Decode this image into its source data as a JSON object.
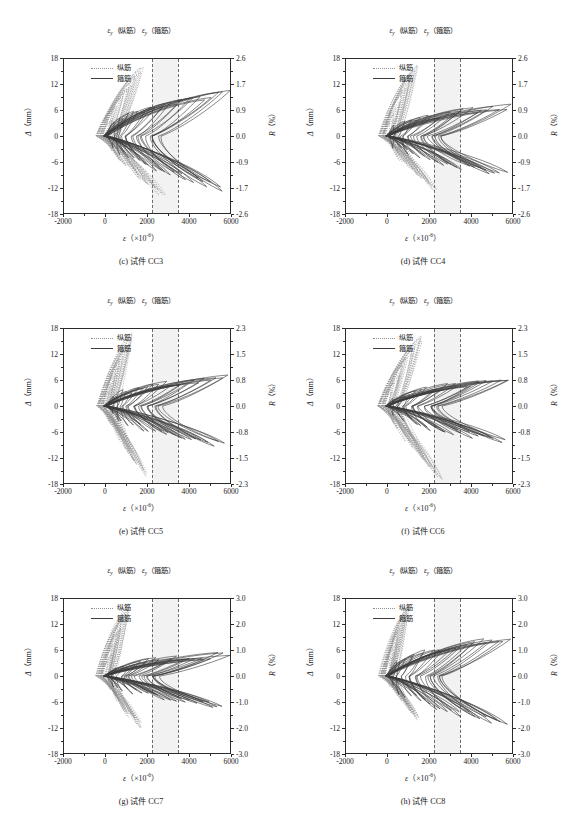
{
  "figure": {
    "annotation_prefix_sym": "ε",
    "annotation_sub": "y",
    "annotation_long": "（纵筋）",
    "annotation_stirrup": "（箍筋）",
    "legend": {
      "longitudinal": "纵筋",
      "stirrup": "箍筋"
    },
    "axis": {
      "left_title_sym": "Δ",
      "left_title_unit": "（mm）",
      "right_title_sym": "R",
      "right_title_unit": "（%）",
      "bottom_title_sym": "ε",
      "bottom_title_unit_pre": "（×10",
      "bottom_title_sup": "-6",
      "bottom_title_unit_post": "）"
    },
    "x_ticks": [
      "-2000",
      "0",
      "2000",
      "4000",
      "6000"
    ],
    "x_range": [
      -2000,
      6000
    ],
    "y_ticks": [
      "18",
      "12",
      "6",
      "0",
      "-6",
      "-12",
      "-18"
    ],
    "y_range": [
      -18,
      18
    ],
    "yield_line_long": 2200,
    "yield_line_stirrup": 3450,
    "colors": {
      "solid_curve": "#3b3b3b",
      "dotted_curve": "#8f8f8f",
      "band": "#f2f2f2",
      "dashed_line": "#6a6a6a",
      "frame": "#2b2b2b"
    }
  },
  "chart_data": [
    {
      "id": "cc3",
      "type": "line",
      "title": "(c) 试件 CC3",
      "caption": "(c) 试件 CC3",
      "xlabel": "ε（×10-6）",
      "ylabel": "Δ（mm）",
      "y2label": "R（%）",
      "xlim": [
        -2000,
        6000
      ],
      "ylim": [
        -18,
        18
      ],
      "y2lim": [
        -2.6,
        2.6
      ],
      "xticks": [
        -2000,
        0,
        2000,
        4000,
        6000
      ],
      "yticks": [
        18,
        12,
        6,
        0,
        -6,
        -12,
        -18
      ],
      "y2ticks": [
        "2.6",
        "1.7",
        "0.9",
        "0.0",
        "-0.9",
        "-1.7",
        "-2.6"
      ],
      "grid": false,
      "legend_position": "top-left",
      "series": [
        {
          "name": "纵筋",
          "style": "dotted",
          "color": "#8f8f8f"
        },
        {
          "name": "箍筋",
          "style": "solid",
          "color": "#3b3b3b"
        }
      ],
      "annotations": [
        {
          "text": "εy（纵筋）",
          "x": 2200,
          "type": "vline-dashed"
        },
        {
          "text": "εy（箍筋）",
          "x": 3450,
          "type": "vline-dashed"
        }
      ],
      "solid_envelope_max_strain": 6000,
      "dotted_envelope_max_strain": 2700,
      "dotted_envelope_min_disp": -14,
      "solid_envelope_max_disp": 10
    },
    {
      "id": "cc4",
      "type": "line",
      "title": "(d) 试件 CC4",
      "caption": "(d) 试件 CC4",
      "xlabel": "ε（×10-6）",
      "ylabel": "Δ（mm）",
      "y2label": "R（%）",
      "xlim": [
        -2000,
        6000
      ],
      "ylim": [
        -18,
        18
      ],
      "y2lim": [
        -2.6,
        2.6
      ],
      "xticks": [
        -2000,
        0,
        2000,
        4000,
        6000
      ],
      "yticks": [
        18,
        12,
        6,
        0,
        -6,
        -12,
        -18
      ],
      "y2ticks": [
        "2.6",
        "1.7",
        "0.9",
        "0.0",
        "-0.9",
        "-1.7",
        "-2.6"
      ],
      "grid": false,
      "legend_position": "top-left",
      "series": [
        {
          "name": "纵筋",
          "style": "dotted",
          "color": "#8f8f8f"
        },
        {
          "name": "箍筋",
          "style": "solid",
          "color": "#3b3b3b"
        }
      ],
      "annotations": [
        {
          "text": "εy（纵筋）",
          "x": 2200,
          "type": "vline-dashed"
        },
        {
          "text": "εy（箍筋）",
          "x": 3450,
          "type": "vline-dashed"
        }
      ],
      "solid_envelope_max_strain": 6000,
      "dotted_envelope_max_strain": 2200,
      "dotted_envelope_min_disp": -13,
      "solid_envelope_max_disp": 7
    },
    {
      "id": "cc5",
      "type": "line",
      "title": "(e) 试件 CC5",
      "caption": "(e) 试件 CC5",
      "xlabel": "ε（×10-6）",
      "ylabel": "Δ（mm）",
      "y2label": "R（%）",
      "xlim": [
        -2000,
        6000
      ],
      "ylim": [
        -18,
        18
      ],
      "y2lim": [
        -2.3,
        2.3
      ],
      "xticks": [
        -2000,
        0,
        2000,
        4000,
        6000
      ],
      "yticks": [
        18,
        12,
        6,
        0,
        -6,
        -12,
        -18
      ],
      "y2ticks": [
        "2.3",
        "1.5",
        "0.8",
        "0.0",
        "-0.8",
        "-1.5",
        "-2.3"
      ],
      "grid": false,
      "legend_position": "top-left",
      "series": [
        {
          "name": "纵筋",
          "style": "dotted",
          "color": "#8f8f8f"
        },
        {
          "name": "箍筋",
          "style": "solid",
          "color": "#3b3b3b"
        }
      ],
      "annotations": [
        {
          "text": "εy（纵筋）",
          "x": 2200,
          "type": "vline-dashed"
        },
        {
          "text": "εy（箍筋）",
          "x": 3450,
          "type": "vline-dashed"
        }
      ],
      "solid_envelope_max_strain": 6000,
      "dotted_envelope_max_strain": 1800,
      "dotted_envelope_min_disp": -16,
      "solid_envelope_max_disp": 7
    },
    {
      "id": "cc6",
      "type": "line",
      "title": "(f) 试件 CC6",
      "caption": "(f) 试件 CC6",
      "xlabel": "ε（×10-6）",
      "ylabel": "Δ（mm）",
      "y2label": "R（%）",
      "xlim": [
        -2000,
        6000
      ],
      "ylim": [
        -18,
        18
      ],
      "y2lim": [
        -2.3,
        2.3
      ],
      "xticks": [
        -2000,
        0,
        2000,
        4000,
        6000
      ],
      "yticks": [
        18,
        12,
        6,
        0,
        -6,
        -12,
        -18
      ],
      "y2ticks": [
        "2.3",
        "1.5",
        "0.8",
        "0.0",
        "-0.8",
        "-1.5",
        "-2.3"
      ],
      "grid": false,
      "legend_position": "top-left",
      "series": [
        {
          "name": "纵筋",
          "style": "dotted",
          "color": "#8f8f8f"
        },
        {
          "name": "箍筋",
          "style": "solid",
          "color": "#3b3b3b"
        }
      ],
      "annotations": [
        {
          "text": "εy（纵筋）",
          "x": 2200,
          "type": "vline-dashed"
        },
        {
          "text": "εy（箍筋）",
          "x": 3450,
          "type": "vline-dashed"
        }
      ],
      "solid_envelope_max_strain": 6000,
      "dotted_envelope_max_strain": 2500,
      "dotted_envelope_min_disp": -17,
      "solid_envelope_max_disp": 6
    },
    {
      "id": "cc7",
      "type": "line",
      "title": "(g) 试件 CC7",
      "caption": "(g) 试件 CC7",
      "xlabel": "ε（×10-6）",
      "ylabel": "Δ（mm）",
      "y2label": "R（%）",
      "xlim": [
        -2000,
        6000
      ],
      "ylim": [
        -18,
        18
      ],
      "y2lim": [
        -3.0,
        3.0
      ],
      "xticks": [
        -2000,
        0,
        2000,
        4000,
        6000
      ],
      "yticks": [
        18,
        12,
        6,
        0,
        -6,
        -12,
        -18
      ],
      "y2ticks": [
        "3.0",
        "2.0",
        "1.0",
        "0.0",
        "-1.0",
        "-2.0",
        "-3.0"
      ],
      "grid": false,
      "legend_position": "top-left",
      "series": [
        {
          "name": "纵筋",
          "style": "dotted",
          "color": "#8f8f8f"
        },
        {
          "name": "箍筋",
          "style": "solid",
          "color": "#3b3b3b"
        }
      ],
      "annotations": [
        {
          "text": "εy（纵筋）",
          "x": 2200,
          "type": "vline-dashed"
        },
        {
          "text": "εy（箍筋）",
          "x": 3450,
          "type": "vline-dashed"
        }
      ],
      "solid_envelope_max_strain": 6000,
      "dotted_envelope_max_strain": 1600,
      "dotted_envelope_min_disp": -12,
      "solid_envelope_max_disp": 5
    },
    {
      "id": "cc8",
      "type": "line",
      "title": "(h) 试件 CC8",
      "caption": "(h) 试件 CC8",
      "xlabel": "ε（×10-6）",
      "ylabel": "Δ（mm）",
      "y2label": "R（%）",
      "xlim": [
        -2000,
        6000
      ],
      "ylim": [
        -18,
        18
      ],
      "y2lim": [
        -3.0,
        3.0
      ],
      "xticks": [
        -2000,
        0,
        2000,
        4000,
        6000
      ],
      "yticks": [
        18,
        12,
        6,
        0,
        -6,
        -12,
        -18
      ],
      "y2ticks": [
        "3.0",
        "2.0",
        "1.0",
        "0.0",
        "-1.0",
        "-2.0",
        "-3.0"
      ],
      "grid": false,
      "legend_position": "top-left",
      "series": [
        {
          "name": "纵筋",
          "style": "dotted",
          "color": "#8f8f8f"
        },
        {
          "name": "箍筋",
          "style": "solid",
          "color": "#3b3b3b"
        }
      ],
      "annotations": [
        {
          "text": "εy（纵筋）",
          "x": 2200,
          "type": "vline-dashed"
        },
        {
          "text": "εy（箍筋）",
          "x": 3450,
          "type": "vline-dashed"
        }
      ],
      "solid_envelope_max_strain": 6000,
      "dotted_envelope_max_strain": 1400,
      "dotted_envelope_min_disp": -10,
      "solid_envelope_max_disp": 9
    }
  ]
}
